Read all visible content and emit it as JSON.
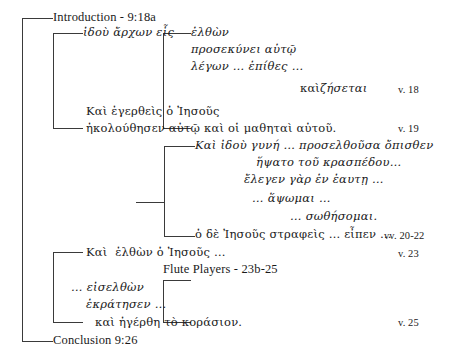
{
  "diagram": {
    "title_top": "Introduction - 9:18a",
    "title_bottom": "Conclusion 9:26",
    "section_heading": "Flute Players - 23b-25",
    "ink_color": "#3a3a3a",
    "background_color": "#ffffff",
    "lines": [
      {
        "id": "l01",
        "text": "Introduction - 9:18a",
        "style": "roman"
      },
      {
        "id": "l02",
        "text": "ἰδοὺ ἄρχων εἷς",
        "style": "greek-italic"
      },
      {
        "id": "l03",
        "text": "ἐλθὼν",
        "style": "greek-italic"
      },
      {
        "id": "l04",
        "text": "προσεκύνει αὐτῷ",
        "style": "greek-italic"
      },
      {
        "id": "l05",
        "text": "λέγων … ἐπίθες …",
        "style": "greek-italic"
      },
      {
        "id": "l06",
        "text": "καὶ",
        "style": "greek"
      },
      {
        "id": "l07",
        "text": "ζήσεται",
        "style": "greek-italic"
      },
      {
        "id": "l08",
        "text": "Καὶ ἐγερθεὶς ὁ Ἰησοῦς",
        "style": "greek"
      },
      {
        "id": "l09",
        "text": "ἠκολούθησεν αὐτῷ καὶ οἱ μαθηταὶ αὐτοῦ.",
        "style": "greek"
      },
      {
        "id": "l10",
        "text": "Καὶ ἰδοὺ γυνή … προσελθοῦσα ὄπισθεν",
        "style": "greek-italic"
      },
      {
        "id": "l11",
        "text": "ἥψατο τοῦ κρασπέδου…",
        "style": "greek-italic"
      },
      {
        "id": "l12",
        "text": "ἔλεγεν γὰρ ἐν ἑαυτῃ …",
        "style": "greek-italic"
      },
      {
        "id": "l13",
        "text": "… ἅψωμαι …",
        "style": "greek-italic"
      },
      {
        "id": "l14",
        "text": "… σωθήσομαι.",
        "style": "greek-italic"
      },
      {
        "id": "l15",
        "text": "ὁ δὲ Ἰησοῦς στραφεὶς … εἶπεν …",
        "style": "greek"
      },
      {
        "id": "l16",
        "text": "Καὶ  ἐλθὼν ὁ Ἰησοῦς …",
        "style": "greek"
      },
      {
        "id": "l17",
        "text": "Flute Players - 23b-25",
        "style": "roman"
      },
      {
        "id": "l18",
        "text": "… εἰσελθὼν",
        "style": "greek-italic"
      },
      {
        "id": "l19",
        "text": "ἐκράτησεν …",
        "style": "greek-italic"
      },
      {
        "id": "l20",
        "text": "καὶ ἠγέρθη τὸ κοράσιον.",
        "style": "greek"
      },
      {
        "id": "l21",
        "text": "Conclusion 9:26",
        "style": "roman"
      }
    ],
    "verse_refs": [
      {
        "id": "v18",
        "text": "v. 18"
      },
      {
        "id": "v19",
        "text": "v. 19"
      },
      {
        "id": "v2022",
        "text": "vv. 20-22"
      },
      {
        "id": "v23",
        "text": "v. 23"
      },
      {
        "id": "v25",
        "text": "v. 25"
      }
    ]
  }
}
